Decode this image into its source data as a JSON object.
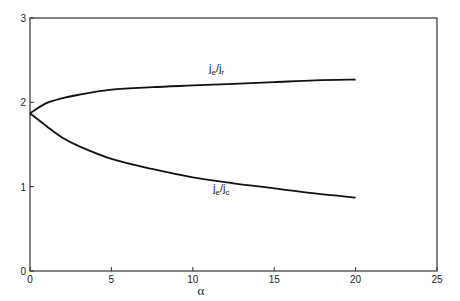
{
  "chart_data": {
    "type": "line",
    "title": "",
    "xlabel": "α",
    "ylabel": "",
    "xlim": [
      0,
      25
    ],
    "ylim": [
      0,
      3
    ],
    "xticks": [
      "0",
      "5",
      "10",
      "15",
      "20",
      "25"
    ],
    "yticks": [
      "0",
      "1",
      "2",
      "3"
    ],
    "grid": false,
    "legend": "inline curve labels",
    "x": [
      0,
      1,
      2,
      3,
      5,
      7.5,
      10,
      12.5,
      15,
      17.5,
      20
    ],
    "series": [
      {
        "name": "je/jr",
        "label_main": "j",
        "label_sub1": "e",
        "label_sep": "/j",
        "label_sub2": "r",
        "values": [
          1.87,
          1.99,
          2.05,
          2.09,
          2.15,
          2.18,
          2.2,
          2.22,
          2.24,
          2.26,
          2.27
        ]
      },
      {
        "name": "je/jc",
        "label_main": "j",
        "label_sub1": "e",
        "label_sep": "/j",
        "label_sub2": "c",
        "values": [
          1.87,
          1.72,
          1.58,
          1.48,
          1.33,
          1.21,
          1.11,
          1.04,
          0.98,
          0.92,
          0.87
        ]
      }
    ]
  }
}
